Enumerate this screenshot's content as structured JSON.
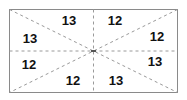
{
  "diagram": {
    "regions": [
      {
        "position": "top-left",
        "value": "13"
      },
      {
        "position": "top-right",
        "value": "12"
      },
      {
        "position": "right-top",
        "value": "12"
      },
      {
        "position": "right-bottom",
        "value": "13"
      },
      {
        "position": "bottom-right",
        "value": "13"
      },
      {
        "position": "bottom-left",
        "value": "12"
      },
      {
        "position": "left-bottom",
        "value": "12"
      },
      {
        "position": "left-top",
        "value": "13"
      }
    ],
    "colors": {
      "border": "#8a8a8a",
      "dash": "#9a9a9a",
      "text": "#111111"
    }
  }
}
